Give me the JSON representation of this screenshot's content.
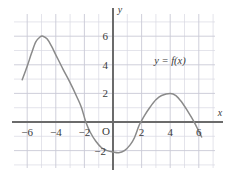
{
  "figure": {
    "background_color": "#ffffff",
    "grid_color": "#d9d9e2",
    "grid_major_color": "#c9c9d6",
    "axis_color": "#6b6b6b",
    "curve_color": "#8a8a8a",
    "text_color": "#3a3a3a"
  },
  "axes": {
    "x_axis_label": "x",
    "y_axis_label": "y",
    "origin_label": "O",
    "x_ticks": [
      {
        "value": -6,
        "label": "−6"
      },
      {
        "value": -4,
        "label": "−4"
      },
      {
        "value": -2,
        "label": "−2"
      },
      {
        "value": 2,
        "label": "2"
      },
      {
        "value": 4,
        "label": "4"
      },
      {
        "value": 6,
        "label": "6"
      }
    ],
    "y_ticks": [
      {
        "value": 6,
        "label": "6"
      },
      {
        "value": 4,
        "label": "4"
      },
      {
        "value": 2,
        "label": "2"
      },
      {
        "value": -2,
        "label": "−2"
      }
    ],
    "xlim": [
      -6.8,
      6.6
    ],
    "ylim": [
      -3.1,
      7.2
    ]
  },
  "annotations": {
    "curve_label": "y  =  f(x)"
  },
  "chart_data": {
    "type": "line",
    "title": "",
    "xlabel": "x",
    "ylabel": "y",
    "xlim": [
      -6.8,
      6.6
    ],
    "ylim": [
      -3.1,
      7.2
    ],
    "grid": true,
    "legend": "none",
    "series": [
      {
        "name": "y = f(x)",
        "color": "#8a8a8a",
        "points": [
          {
            "x": -6.35,
            "y": 2.95
          },
          {
            "x": -6.0,
            "y": 3.9
          },
          {
            "x": -5.7,
            "y": 4.8
          },
          {
            "x": -5.4,
            "y": 5.6
          },
          {
            "x": -5.1,
            "y": 5.95
          },
          {
            "x": -4.9,
            "y": 6.0
          },
          {
            "x": -4.6,
            "y": 5.8
          },
          {
            "x": -4.3,
            "y": 5.3
          },
          {
            "x": -4.0,
            "y": 4.7
          },
          {
            "x": -3.5,
            "y": 3.7
          },
          {
            "x": -3.0,
            "y": 2.75
          },
          {
            "x": -2.5,
            "y": 1.7
          },
          {
            "x": -2.2,
            "y": 1.0
          },
          {
            "x": -1.9,
            "y": 0.0
          },
          {
            "x": -1.6,
            "y": -0.7
          },
          {
            "x": -1.2,
            "y": -1.35
          },
          {
            "x": -0.8,
            "y": -1.8
          },
          {
            "x": -0.4,
            "y": -2.0
          },
          {
            "x": 0.0,
            "y": -2.1
          },
          {
            "x": 0.4,
            "y": -2.15
          },
          {
            "x": 0.8,
            "y": -2.0
          },
          {
            "x": 1.2,
            "y": -1.6
          },
          {
            "x": 1.5,
            "y": -1.1
          },
          {
            "x": 1.8,
            "y": -0.3
          },
          {
            "x": 1.95,
            "y": 0.0
          },
          {
            "x": 2.2,
            "y": 0.45
          },
          {
            "x": 2.6,
            "y": 1.05
          },
          {
            "x": 3.0,
            "y": 1.55
          },
          {
            "x": 3.4,
            "y": 1.85
          },
          {
            "x": 4.0,
            "y": 2.0
          },
          {
            "x": 4.4,
            "y": 1.85
          },
          {
            "x": 4.8,
            "y": 1.4
          },
          {
            "x": 5.2,
            "y": 0.8
          },
          {
            "x": 5.5,
            "y": 0.3
          },
          {
            "x": 5.75,
            "y": -0.15
          },
          {
            "x": 6.0,
            "y": -0.65
          },
          {
            "x": 6.2,
            "y": -1.05
          }
        ]
      }
    ],
    "key_features": {
      "local_maximum_left": {
        "x": -4.9,
        "y": 6
      },
      "local_minimum": {
        "x": 0.4,
        "y": -2.15
      },
      "local_maximum_right": {
        "x": 4,
        "y": 2
      },
      "x_intercepts": [
        -1.9,
        1.95,
        5.7
      ]
    }
  }
}
